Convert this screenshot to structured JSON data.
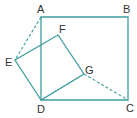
{
  "diagram": {
    "type": "geometry",
    "line_color": "#3f9d9d",
    "label_color": "#333333",
    "points": {
      "A": {
        "label": "A",
        "x": 41,
        "y": 17,
        "lx": 37,
        "ly": 13
      },
      "B": {
        "label": "B",
        "x": 128,
        "y": 17,
        "lx": 123,
        "ly": 13
      },
      "C": {
        "label": "C",
        "x": 128,
        "y": 100,
        "lx": 126,
        "ly": 112
      },
      "D": {
        "label": "D",
        "x": 41,
        "y": 100,
        "lx": 37,
        "ly": 113
      },
      "E": {
        "label": "E",
        "x": 15,
        "y": 60,
        "lx": 5,
        "ly": 66
      },
      "F": {
        "label": "F",
        "x": 58,
        "y": 35,
        "lx": 59,
        "ly": 33
      },
      "G": {
        "label": "G",
        "x": 84,
        "y": 74,
        "lx": 85,
        "ly": 74
      }
    },
    "square_ABCD": [
      "A",
      "B",
      "C",
      "D"
    ],
    "square_DEFG": [
      "D",
      "E",
      "F",
      "G"
    ],
    "dashed_segments": [
      [
        "A",
        "E"
      ],
      [
        "G",
        "C"
      ]
    ]
  }
}
